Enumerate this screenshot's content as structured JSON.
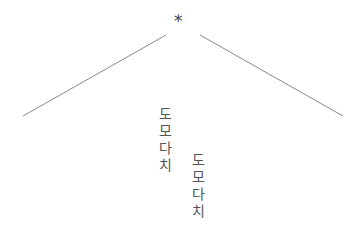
{
  "figure": {
    "asterisk": "*",
    "left_line": {
      "x1": 23,
      "y1": 116,
      "x2": 166,
      "y2": 35,
      "color": "#8a8a8a"
    },
    "right_line": {
      "x1": 200,
      "y1": 35,
      "x2": 343,
      "y2": 116,
      "color": "#8a8a8a"
    },
    "columns": [
      {
        "chars": [
          "도",
          "모",
          "다",
          "치"
        ]
      },
      {
        "chars": [
          "도",
          "모",
          "다",
          "치"
        ]
      }
    ]
  }
}
